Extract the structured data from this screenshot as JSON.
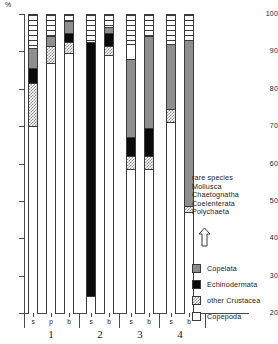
{
  "axis": {
    "unit_label": "%",
    "y_ticks": [
      100,
      90,
      80,
      70,
      60,
      50,
      40,
      30,
      20
    ],
    "ylim": [
      20,
      100
    ]
  },
  "groups": [
    {
      "number": "1",
      "stations": [
        "s",
        "p",
        "b"
      ]
    },
    {
      "number": "2",
      "stations": [
        "s",
        "b"
      ]
    },
    {
      "number": "3",
      "stations": [
        "s",
        "b"
      ]
    },
    {
      "number": "4",
      "stations": [
        "s",
        "b"
      ]
    }
  ],
  "legend": {
    "rare_lines": [
      "rare species",
      "Mollusca",
      "Chaetognatha",
      "Coelenterata",
      "Polychaeta"
    ],
    "arrow_icon": "up-arrow-icon",
    "items": [
      {
        "label": "Copelata",
        "fill": "copelata",
        "color": "#8e8e8e"
      },
      {
        "label": "Echinodermata",
        "fill": "echino",
        "color": "#0a0a0a"
      },
      {
        "label": "other Crustacea",
        "fill": "crustacea",
        "color": "#8c8c8c"
      },
      {
        "label": "Copepoda",
        "fill": "copepoda",
        "color": "#ffffff"
      }
    ]
  },
  "chart_data": {
    "type": "bar",
    "title": "",
    "xlabel": "",
    "ylabel": "%",
    "ylim": [
      20,
      100
    ],
    "grid": false,
    "legend_position": "right",
    "note": "Stacked percentage composition bars; values are cumulative top boundaries in % read off the y-axis.",
    "categories": [
      "1s",
      "1p",
      "1b",
      "2s",
      "2b",
      "3s",
      "3b",
      "4s",
      "4b"
    ],
    "series": [
      {
        "name": "Copepoda",
        "values": [
          70.0,
          87.0,
          89.5,
          24.5,
          89.0,
          62.5,
          58.5,
          71.0,
          47.0
        ]
      },
      {
        "name": "other Crustacea",
        "values": [
          11.5,
          4.5,
          3.0,
          0.0,
          2.5,
          3.5,
          3.5,
          3.5,
          1.5
        ]
      },
      {
        "name": "Echinodermata",
        "values": [
          4.0,
          0.0,
          2.5,
          68.0,
          3.5,
          5.0,
          7.5,
          0.0,
          0.0
        ]
      },
      {
        "name": "Copelata",
        "values": [
          5.5,
          2.5,
          3.0,
          0.0,
          1.5,
          21.0,
          24.5,
          17.5,
          44.5
        ]
      },
      {
        "name": "rare group",
        "values": [
          9.0,
          6.0,
          2.0,
          7.5,
          3.5,
          8.0,
          6.0,
          8.0,
          7.0
        ]
      }
    ],
    "bars": [
      {
        "id": "1s",
        "group": "1",
        "station": "s",
        "segments": [
          {
            "type": "copepoda",
            "from": 20.0,
            "to": 70.0
          },
          {
            "type": "crustacea",
            "from": 70.0,
            "to": 81.5
          },
          {
            "type": "echino",
            "from": 81.5,
            "to": 85.5
          },
          {
            "type": "copelata",
            "from": 85.5,
            "to": 91.0
          },
          {
            "type": "rare",
            "from": 91.0,
            "to": 100.0
          }
        ]
      },
      {
        "id": "1p",
        "group": "1",
        "station": "p",
        "segments": [
          {
            "type": "copepoda",
            "from": 20.0,
            "to": 87.0
          },
          {
            "type": "crustacea",
            "from": 87.0,
            "to": 91.5
          },
          {
            "type": "copelata",
            "from": 91.5,
            "to": 94.0
          },
          {
            "type": "rare",
            "from": 94.0,
            "to": 100.0
          }
        ]
      },
      {
        "id": "1b",
        "group": "1",
        "station": "b",
        "segments": [
          {
            "type": "copepoda",
            "from": 20.0,
            "to": 89.5
          },
          {
            "type": "crustacea",
            "from": 89.5,
            "to": 92.5
          },
          {
            "type": "echino",
            "from": 92.5,
            "to": 95.0
          },
          {
            "type": "copelata",
            "from": 95.0,
            "to": 98.0
          },
          {
            "type": "rare",
            "from": 98.0,
            "to": 100.0
          }
        ]
      },
      {
        "id": "2s",
        "group": "2",
        "station": "s",
        "segments": [
          {
            "type": "copepoda",
            "from": 20.0,
            "to": 24.5
          },
          {
            "type": "echino",
            "from": 24.5,
            "to": 92.5
          },
          {
            "type": "rare",
            "from": 92.5,
            "to": 100.0
          }
        ]
      },
      {
        "id": "2b",
        "group": "2",
        "station": "b",
        "segments": [
          {
            "type": "copepoda",
            "from": 20.0,
            "to": 89.0
          },
          {
            "type": "crustacea",
            "from": 89.0,
            "to": 91.5
          },
          {
            "type": "echino",
            "from": 91.5,
            "to": 95.0
          },
          {
            "type": "copelata",
            "from": 95.0,
            "to": 96.5
          },
          {
            "type": "rare",
            "from": 96.5,
            "to": 100.0
          }
        ]
      },
      {
        "id": "3s",
        "group": "3",
        "station": "s",
        "segments": [
          {
            "type": "copepoda",
            "from": 20.0,
            "to": 58.5
          },
          {
            "type": "crustacea",
            "from": 58.5,
            "to": 62.0
          },
          {
            "type": "echino",
            "from": 62.0,
            "to": 67.0
          },
          {
            "type": "copelata",
            "from": 67.0,
            "to": 88.0
          },
          {
            "type": "copepoda2",
            "from": 88.0,
            "to": 92.0
          },
          {
            "type": "rare",
            "from": 92.0,
            "to": 100.0
          }
        ]
      },
      {
        "id": "3b",
        "group": "3",
        "station": "b",
        "segments": [
          {
            "type": "copepoda",
            "from": 20.0,
            "to": 58.5
          },
          {
            "type": "crustacea",
            "from": 58.5,
            "to": 62.0
          },
          {
            "type": "echino",
            "from": 62.0,
            "to": 69.5
          },
          {
            "type": "copelata",
            "from": 69.5,
            "to": 94.0
          },
          {
            "type": "rare",
            "from": 94.0,
            "to": 100.0
          }
        ]
      },
      {
        "id": "4s",
        "group": "4",
        "station": "s",
        "segments": [
          {
            "type": "copepoda",
            "from": 20.0,
            "to": 71.0
          },
          {
            "type": "crustacea",
            "from": 71.0,
            "to": 74.5
          },
          {
            "type": "copelata",
            "from": 74.5,
            "to": 92.0
          },
          {
            "type": "rare",
            "from": 92.0,
            "to": 100.0
          }
        ]
      },
      {
        "id": "4b",
        "group": "4",
        "station": "b",
        "segments": [
          {
            "type": "copepoda",
            "from": 20.0,
            "to": 47.0
          },
          {
            "type": "crustacea",
            "from": 47.0,
            "to": 48.5
          },
          {
            "type": "copelata",
            "from": 48.5,
            "to": 93.0
          },
          {
            "type": "rare",
            "from": 93.0,
            "to": 100.0
          }
        ]
      }
    ]
  }
}
